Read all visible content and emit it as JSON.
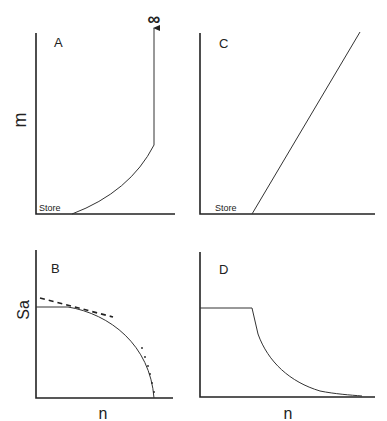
{
  "panels": {
    "A": {
      "letter": "A",
      "ylabel": "m",
      "store_label": "Store",
      "infinity": "∞"
    },
    "B": {
      "letter": "B",
      "ylabel": "Sa",
      "xlabel": "n"
    },
    "C": {
      "letter": "C",
      "store_label": "Store"
    },
    "D": {
      "letter": "D",
      "xlabel": "n"
    }
  },
  "colors": {
    "line": "#222222",
    "background": "#ffffff"
  }
}
